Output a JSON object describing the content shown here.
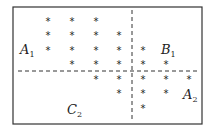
{
  "diagram": {
    "type": "partition-scatter",
    "frame": {
      "x": 13,
      "y": 7,
      "width": 189,
      "height": 117,
      "stroke": "#333333"
    },
    "dividers": {
      "vertical": {
        "x": 132,
        "y1": 10,
        "y2": 120,
        "style": "dashed"
      },
      "horizontal": {
        "y": 71,
        "x1": 18,
        "x2": 197,
        "style": "dashed"
      }
    },
    "columns_x": [
      48,
      72,
      96,
      119,
      143,
      166,
      189
    ],
    "rows_y": [
      21,
      35,
      50,
      64,
      79,
      93,
      108
    ],
    "marker": "*",
    "points": [
      {
        "row": 0,
        "col": 0
      },
      {
        "row": 0,
        "col": 1
      },
      {
        "row": 0,
        "col": 2
      },
      {
        "row": 1,
        "col": 0
      },
      {
        "row": 1,
        "col": 1
      },
      {
        "row": 1,
        "col": 2
      },
      {
        "row": 1,
        "col": 3
      },
      {
        "row": 2,
        "col": 0
      },
      {
        "row": 2,
        "col": 1
      },
      {
        "row": 2,
        "col": 2
      },
      {
        "row": 2,
        "col": 3
      },
      {
        "row": 2,
        "col": 4
      },
      {
        "row": 3,
        "col": 1
      },
      {
        "row": 3,
        "col": 2
      },
      {
        "row": 3,
        "col": 3
      },
      {
        "row": 3,
        "col": 4
      },
      {
        "row": 3,
        "col": 5
      },
      {
        "row": 4,
        "col": 2
      },
      {
        "row": 4,
        "col": 3
      },
      {
        "row": 4,
        "col": 4
      },
      {
        "row": 4,
        "col": 5
      },
      {
        "row": 4,
        "col": 6
      },
      {
        "row": 5,
        "col": 3
      },
      {
        "row": 5,
        "col": 4
      },
      {
        "row": 5,
        "col": 5
      },
      {
        "row": 6,
        "col": 4
      }
    ],
    "labels": [
      {
        "name": "label-a1",
        "base": "A",
        "sub": "1",
        "x": 20,
        "y": 54
      },
      {
        "name": "label-b1",
        "base": "B",
        "sub": "1",
        "x": 161,
        "y": 54
      },
      {
        "name": "label-a2",
        "base": "A",
        "sub": "2",
        "x": 183,
        "y": 99
      },
      {
        "name": "label-c2",
        "base": "C",
        "sub": "2",
        "x": 67,
        "y": 114
      }
    ]
  }
}
